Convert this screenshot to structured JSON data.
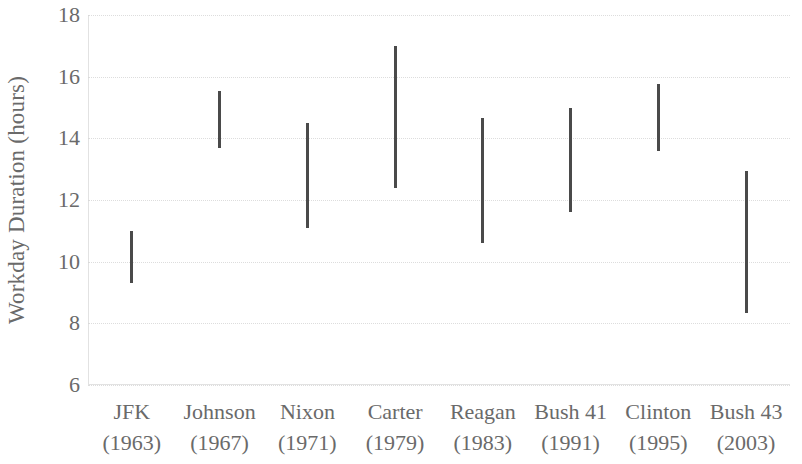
{
  "chart_data": {
    "type": "bar",
    "subtype": "range-floating-bar",
    "title": "",
    "subtitle": "",
    "xlabel": "",
    "ylabel": "Workday Duration (hours)",
    "ylim": [
      6,
      18
    ],
    "ytick_labels": [
      "18",
      "16",
      "14",
      "12",
      "10",
      "8",
      "6"
    ],
    "ytick_values": [
      18,
      16,
      14,
      12,
      10,
      8,
      6
    ],
    "grid": true,
    "grid_axis": "y",
    "legend": "none",
    "bar_color": "#4a4a4a",
    "grid_color": "#d8d8d8",
    "text_color": "#6a6a6a",
    "categories": [
      "JFK (1963)",
      "Johnson (1967)",
      "Nixon (1971)",
      "Carter (1979)",
      "Reagan (1983)",
      "Bush 41 (1991)",
      "Clinton (1995)",
      "Bush 43 (2003)"
    ],
    "xtick_labels": [
      {
        "name": "JFK",
        "year": "(1963)"
      },
      {
        "name": "Johnson",
        "year": "(1967)"
      },
      {
        "name": "Nixon",
        "year": "(1971)"
      },
      {
        "name": "Carter",
        "year": "(1979)"
      },
      {
        "name": "Reagan",
        "year": "(1983)"
      },
      {
        "name": "Bush 41",
        "year": "(1991)"
      },
      {
        "name": "Clinton",
        "year": "(1995)"
      },
      {
        "name": "Bush 43",
        "year": "(2003)"
      }
    ],
    "points": [
      {
        "category": "JFK",
        "low": 9.3,
        "high": 11.0
      },
      {
        "category": "Johnson",
        "low": 13.7,
        "high": 15.55
      },
      {
        "category": "Nixon",
        "low": 11.1,
        "high": 14.5
      },
      {
        "category": "Carter",
        "low": 12.4,
        "high": 17.0
      },
      {
        "category": "Reagan",
        "low": 10.6,
        "high": 14.65
      },
      {
        "category": "Bush 41",
        "low": 11.6,
        "high": 15.0
      },
      {
        "category": "Clinton",
        "low": 13.6,
        "high": 15.75
      },
      {
        "category": "Bush 43",
        "low": 8.35,
        "high": 12.95
      }
    ],
    "series": [
      {
        "name": "low",
        "values": [
          9.3,
          13.7,
          11.1,
          12.4,
          10.6,
          11.6,
          13.6,
          8.35
        ]
      },
      {
        "name": "high",
        "values": [
          11.0,
          15.55,
          14.5,
          17.0,
          14.65,
          15.0,
          15.75,
          12.95
        ]
      }
    ]
  }
}
